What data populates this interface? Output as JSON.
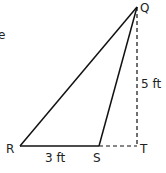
{
  "partial_text": "e",
  "points": {
    "Q": {
      "label": "Q",
      "x": 137,
      "y": 7
    },
    "R": {
      "label": "R",
      "x": 20,
      "y": 146
    },
    "S": {
      "label": "S",
      "x": 99,
      "y": 146
    },
    "T": {
      "label": "T",
      "x": 137,
      "y": 146
    }
  },
  "measurements": {
    "RS": "3 ft",
    "QT": "5 ft"
  },
  "colors": {
    "line": "#111111",
    "text": "#222222"
  }
}
